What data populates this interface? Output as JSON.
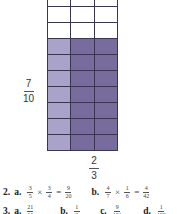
{
  "grid": {
    "rows": 10,
    "cols": 3,
    "shaded_rows": 7,
    "overlap_cols": 2,
    "colors": {
      "empty": "#ffffff",
      "light": "#aaa3c9",
      "dark": "#786c9f",
      "line": "#3a3550"
    }
  },
  "labels": {
    "row_fraction": {
      "num": "7",
      "den": "10"
    },
    "col_fraction": {
      "num": "2",
      "den": "3"
    }
  },
  "answers": {
    "q2": {
      "number": "2.",
      "a": {
        "label": "a.",
        "f1n": "3",
        "f1d": "5",
        "op": "×",
        "f2n": "3",
        "f2d": "4",
        "eq": "=",
        "rn": "9",
        "rd": "20"
      },
      "b": {
        "label": "b.",
        "f1n": "4",
        "f1d": "7",
        "op": "×",
        "f2n": "1",
        "f2d": "6",
        "eq": "=",
        "rn": "4",
        "rd": "42"
      }
    },
    "q3": {
      "number": "3.",
      "a": {
        "label": "a.",
        "n": "21",
        "d": "11"
      },
      "b": {
        "label": "b.",
        "n": "1",
        "d": "3"
      },
      "c": {
        "label": "c.",
        "n": "9",
        "d": "121"
      },
      "d": {
        "label": "d.",
        "n": "1",
        "d": "100"
      }
    }
  }
}
